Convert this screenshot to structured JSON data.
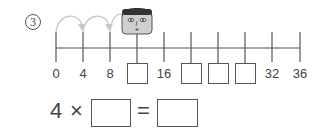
{
  "problem": {
    "number": "3",
    "number_line": {
      "start": 0,
      "end": 36,
      "step": 4,
      "ticks": [
        {
          "value": "0",
          "type": "label"
        },
        {
          "value": "4",
          "type": "label"
        },
        {
          "value": "8",
          "type": "label"
        },
        {
          "value": "",
          "type": "blank",
          "note": "face marker above"
        },
        {
          "value": "16",
          "type": "label"
        },
        {
          "value": "",
          "type": "blank"
        },
        {
          "value": "",
          "type": "blank"
        },
        {
          "value": "",
          "type": "blank"
        },
        {
          "value": "32",
          "type": "label"
        },
        {
          "value": "36",
          "type": "label"
        }
      ],
      "jump_arrows": [
        [
          "0",
          "4"
        ],
        [
          "4",
          "8"
        ],
        [
          "8",
          "12"
        ]
      ],
      "marker_icon": "face-icon"
    },
    "equation": {
      "left": "4",
      "operator": "×",
      "equals": "=",
      "blank1": "",
      "blank2": ""
    }
  },
  "colors": {
    "line": "#555555",
    "arrow": "#c8c8c8",
    "text": "#444444"
  }
}
